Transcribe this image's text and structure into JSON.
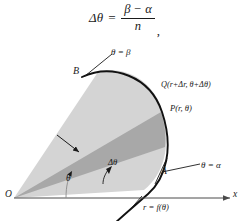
{
  "figure": {
    "type": "polar-area-diagram",
    "formula": {
      "lhs": "Δθ",
      "equals": "=",
      "numerator": "β − α",
      "denominator": "n",
      "trailing_punctuation": ","
    },
    "labels": {
      "point_b": "B",
      "ray_beta": "θ = β",
      "point_q": "Q(r+Δr, θ+Δθ)",
      "point_p": "P(r, θ)",
      "point_a": "A",
      "ray_alpha": "θ = α",
      "curve": "r = f(θ)",
      "angle_theta": "θ",
      "angle_delta_theta": "Δθ",
      "origin": "O",
      "x_axis": "x"
    },
    "colors": {
      "background": "#ffffff",
      "region_light": "#d4d4d4",
      "region_dark": "#a8a8a8",
      "stroke": "#1a1a1a",
      "axis": "#4a4a4a",
      "curve": "#111111"
    }
  }
}
